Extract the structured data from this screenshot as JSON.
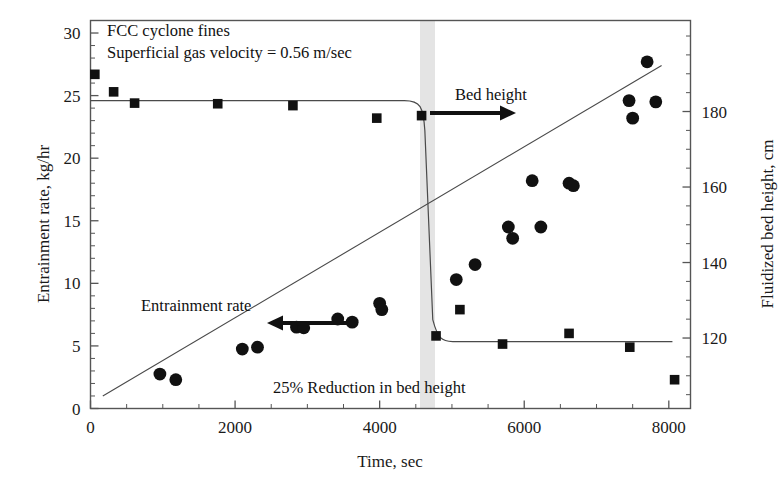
{
  "figure": {
    "background": "#ffffff",
    "frame_color": "#4d4d4d",
    "marker_color": "#111111",
    "band_color": "#e2e2e2"
  },
  "annotations": {
    "note_line1": "FCC cyclone fines",
    "note_line2": "Superficial gas velocity = 0.56 m/sec",
    "bed_height_label": "Bed height",
    "entrainment_label": "Entrainment rate",
    "reduction_label": "25% Reduction in bed height"
  },
  "chart_data": {
    "type": "scatter",
    "title": "",
    "xlabel": "Time, sec",
    "ylabel": "Entrainment rate, kg/hr",
    "y2label": "Fluidized bed height, cm",
    "xlim": [
      0,
      8300
    ],
    "ylim": [
      0,
      31
    ],
    "y2lim": [
      101.333,
      204.111
    ],
    "xticks": [
      0,
      2000,
      4000,
      6000,
      8000
    ],
    "xtick_labels": [
      "0",
      "2000",
      "4000",
      "6000",
      "8000"
    ],
    "xminor_step": 500,
    "yticks": [
      0,
      5,
      10,
      15,
      20,
      25,
      30
    ],
    "ytick_labels": [
      "0",
      "5",
      "10",
      "15",
      "20",
      "25",
      "30"
    ],
    "yminor_step": 1,
    "y2ticks": [
      120,
      140,
      160,
      180
    ],
    "y2tick_labels": [
      "120",
      "140",
      "160",
      "180"
    ],
    "grid": false,
    "legend": "none",
    "event_band": {
      "x_start": 4540,
      "x_end": 4740,
      "label": "25% Reduction in bed height"
    },
    "series": [
      {
        "name": "Entrainment rate",
        "marker": "circle",
        "axis": "left",
        "unit": "kg/hr",
        "points": [
          {
            "x": 960,
            "y": 2.75
          },
          {
            "x": 1180,
            "y": 2.3
          },
          {
            "x": 2100,
            "y": 4.75
          },
          {
            "x": 2310,
            "y": 4.9
          },
          {
            "x": 2850,
            "y": 6.5
          },
          {
            "x": 2950,
            "y": 6.45
          },
          {
            "x": 3420,
            "y": 7.15
          },
          {
            "x": 3620,
            "y": 6.9
          },
          {
            "x": 4000,
            "y": 8.4
          },
          {
            "x": 4030,
            "y": 7.9
          },
          {
            "x": 5060,
            "y": 10.3
          },
          {
            "x": 5320,
            "y": 11.5
          },
          {
            "x": 5780,
            "y": 14.5
          },
          {
            "x": 5840,
            "y": 13.6
          },
          {
            "x": 6110,
            "y": 18.2
          },
          {
            "x": 6230,
            "y": 14.5
          },
          {
            "x": 6620,
            "y": 18.0
          },
          {
            "x": 6680,
            "y": 17.8
          },
          {
            "x": 7450,
            "y": 24.6
          },
          {
            "x": 7500,
            "y": 23.2
          },
          {
            "x": 7700,
            "y": 27.7
          },
          {
            "x": 7820,
            "y": 24.5
          }
        ],
        "trend_line": {
          "x1": 170,
          "y1": 1.0,
          "x2": 7900,
          "y2": 27.4
        }
      },
      {
        "name": "Bed height",
        "marker": "square",
        "axis": "right",
        "unit": "cm",
        "points_left_scale": [
          {
            "x": 60,
            "y": 26.7
          },
          {
            "x": 320,
            "y": 25.3
          },
          {
            "x": 610,
            "y": 24.4
          },
          {
            "x": 1760,
            "y": 24.35
          },
          {
            "x": 2800,
            "y": 24.2
          },
          {
            "x": 3960,
            "y": 23.2
          },
          {
            "x": 4580,
            "y": 23.4
          },
          {
            "x": 4780,
            "y": 5.8
          },
          {
            "x": 5110,
            "y": 7.9
          },
          {
            "x": 5700,
            "y": 5.15
          },
          {
            "x": 6620,
            "y": 6.0
          },
          {
            "x": 7460,
            "y": 4.9
          },
          {
            "x": 8080,
            "y": 2.3
          }
        ],
        "step_line": {
          "pre_level": 24.6,
          "post_level": 5.35,
          "drop_x_start": 4480,
          "drop_x_end": 4790
        }
      }
    ]
  }
}
